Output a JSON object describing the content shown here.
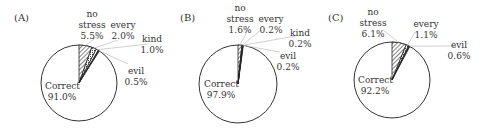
{
  "chart_data": [
    {
      "type": "pie",
      "title": "(A)",
      "categories": [
        "Correct",
        "no stress",
        "every",
        "kind",
        "evil"
      ],
      "values": [
        91.0,
        5.5,
        2.0,
        1.0,
        0.5
      ],
      "labels": {
        "correct": [
          "Correct",
          "91.0%"
        ],
        "no_stress": [
          "no",
          "stress",
          "5.5%"
        ],
        "every": [
          "every",
          "2.0%"
        ],
        "kind": [
          "kind",
          "1.0%"
        ],
        "evil": [
          "evil",
          "0.5%"
        ]
      }
    },
    {
      "type": "pie",
      "title": "(B)",
      "categories": [
        "Correct",
        "no stress",
        "every",
        "kind",
        "evil"
      ],
      "values": [
        97.9,
        1.6,
        0.2,
        0.2,
        0.2
      ],
      "labels": {
        "correct": [
          "Correct",
          "97.9%"
        ],
        "no_stress": [
          "no",
          "stress",
          "1.6%"
        ],
        "every": [
          "every",
          "0.2%"
        ],
        "kind": [
          "kind",
          "0.2%"
        ],
        "evil": [
          "evil",
          "0.2%"
        ]
      }
    },
    {
      "type": "pie",
      "title": "(C)",
      "categories": [
        "Correct",
        "no stress",
        "every",
        "evil"
      ],
      "values": [
        92.2,
        6.1,
        1.1,
        0.6
      ],
      "labels": {
        "correct": [
          "Correct",
          "92.2%"
        ],
        "no_stress": [
          "no",
          "stress",
          "6.1%"
        ],
        "every": [
          "every",
          "1.1%"
        ],
        "evil": [
          "evil",
          "0.6%"
        ]
      }
    }
  ]
}
